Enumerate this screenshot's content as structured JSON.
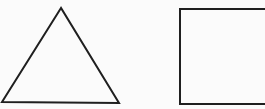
{
  "diagram": {
    "title": "",
    "shapes": [
      {
        "kind": "triangle",
        "label": "triangle",
        "stroke": "#1f1f1f",
        "fill": "none"
      },
      {
        "kind": "rectangle",
        "label": "square",
        "stroke": "#1f1f1f",
        "fill": "none"
      }
    ],
    "background": "#fbfbfb"
  }
}
